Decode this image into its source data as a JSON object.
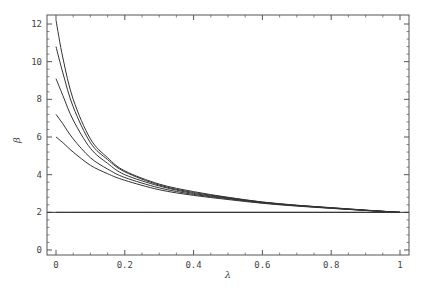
{
  "chart_data": {
    "type": "line",
    "title": "",
    "xlabel": "λ",
    "ylabel": "β",
    "xlim": [
      -0.02,
      1.02
    ],
    "ylim": [
      -0.3,
      12.6
    ],
    "xticks": [
      0,
      0.2,
      0.4,
      0.6,
      0.8,
      1
    ],
    "xtick_labels": [
      "0",
      "0.2",
      "0.4",
      "0.6",
      "0.8",
      "1"
    ],
    "yticks": [
      0,
      2,
      4,
      6,
      8,
      10,
      12
    ],
    "ytick_labels": [
      "0",
      "2",
      "4",
      "6",
      "8",
      "10",
      "12"
    ],
    "grid": false,
    "legend": null,
    "x": [
      0.0,
      0.02,
      0.05,
      0.1,
      0.15,
      0.2,
      0.3,
      0.4,
      0.5,
      0.6,
      0.7,
      0.8,
      0.9,
      1.0
    ],
    "series": [
      {
        "name": "curve-1",
        "values": [
          12.2,
          10.2,
          8.0,
          5.9,
          4.9,
          4.2,
          3.5,
          3.1,
          2.8,
          2.55,
          2.38,
          2.25,
          2.12,
          2.0
        ]
      },
      {
        "name": "curve-2",
        "values": [
          10.8,
          9.4,
          7.6,
          5.7,
          4.8,
          4.15,
          3.45,
          3.05,
          2.78,
          2.54,
          2.37,
          2.24,
          2.11,
          2.0
        ]
      },
      {
        "name": "curve-3",
        "values": [
          9.1,
          8.2,
          6.9,
          5.4,
          4.6,
          4.0,
          3.4,
          3.0,
          2.75,
          2.52,
          2.36,
          2.23,
          2.11,
          2.0
        ]
      },
      {
        "name": "curve-4",
        "values": [
          7.2,
          6.7,
          5.9,
          4.9,
          4.3,
          3.85,
          3.3,
          2.95,
          2.72,
          2.5,
          2.35,
          2.22,
          2.1,
          2.0
        ]
      },
      {
        "name": "curve-5",
        "values": [
          6.0,
          5.7,
          5.2,
          4.5,
          4.05,
          3.7,
          3.2,
          2.9,
          2.68,
          2.48,
          2.33,
          2.21,
          2.1,
          2.0
        ]
      },
      {
        "name": "baseline",
        "values": [
          2.0,
          2.0,
          2.0,
          2.0,
          2.0,
          2.0,
          2.0,
          2.0,
          2.0,
          2.0,
          2.0,
          2.0,
          2.0,
          2.0
        ]
      }
    ],
    "colors": {
      "line": "#333333",
      "frame": "#555555",
      "text": "#444444"
    }
  }
}
